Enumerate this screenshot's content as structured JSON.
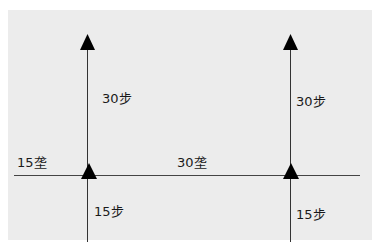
{
  "diagram": {
    "background_color": "#ececec",
    "line_color": "#333333",
    "labels": {
      "left_top": "30步",
      "right_top": "30步",
      "left_bottom": "15步",
      "right_bottom": "15步",
      "horizontal_left": "15垄",
      "horizontal_middle": "30垄"
    }
  }
}
